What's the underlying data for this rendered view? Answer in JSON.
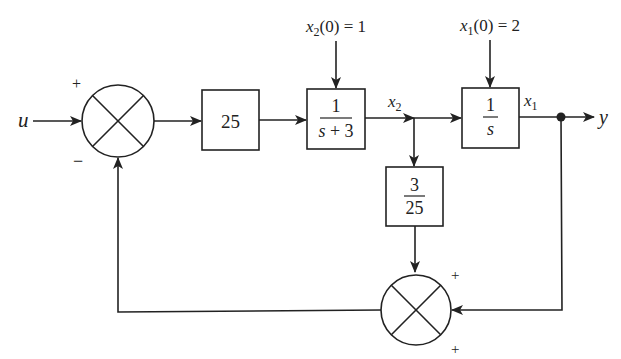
{
  "diagram": {
    "type": "block-diagram",
    "input_label": "u",
    "output_label": "y",
    "summing_junction_1": {
      "top_sign": "+",
      "bottom_sign": "−"
    },
    "gain_block": {
      "label": "25"
    },
    "block_2": {
      "numerator": "1",
      "denominator": "s + 3",
      "initial_condition": "x₂(0) = 1",
      "output_label": "x₂"
    },
    "block_3": {
      "numerator": "1",
      "denominator": "s",
      "initial_condition": "x₁(0) = 2",
      "output_label": "x₁"
    },
    "feedback_block": {
      "numerator": "3",
      "denominator": "25"
    },
    "summing_junction_2": {
      "top_sign": "+",
      "bottom_sign": "+"
    }
  }
}
